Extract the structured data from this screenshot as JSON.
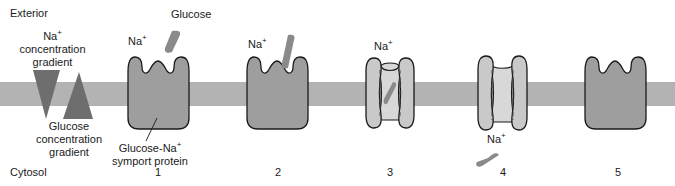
{
  "figure": {
    "type": "diagram",
    "compartments": {
      "top_label": "Exterior",
      "bottom_label": "Cytosol"
    },
    "gradients": [
      {
        "id": "na-gradient",
        "label_lines": [
          "Na",
          "concentration",
          "gradient"
        ],
        "line1_text": "Na",
        "line1_sup": "+",
        "line2_text": "concentration",
        "line3_text": "gradient",
        "direction": "downward",
        "shape": "triangle-pointing-down",
        "color": "#6e6e6e"
      },
      {
        "id": "glucose-gradient",
        "label_lines": [
          "Glucose",
          "concentration",
          "gradient"
        ],
        "line1_text": "Glucose",
        "line2_text": "concentration",
        "line3_text": "gradient",
        "direction": "upward",
        "shape": "triangle-pointing-up",
        "color": "#6e6e6e"
      }
    ],
    "protein_callout": {
      "line1_text": "Glucose-Na",
      "line1_sup": "+",
      "line2_text": "symport  protein"
    },
    "molecule_labels": {
      "sodium": "Na",
      "sodium_charge": "+",
      "glucose": "Glucose"
    },
    "steps": [
      {
        "number": "1",
        "state": "open-to-exterior, unbound",
        "na_label": "Na",
        "na_sup": "+",
        "glucose_label": "Glucose"
      },
      {
        "number": "2",
        "state": "glucose and Na+ binding from exterior",
        "na_label": "Na",
        "na_sup": "+"
      },
      {
        "number": "3",
        "state": "occluded, solutes enclosed in channel",
        "na_label": "Na",
        "na_sup": "+"
      },
      {
        "number": "4",
        "state": "open-to-cytosol, solutes released",
        "na_label": "Na",
        "na_sup": "+"
      },
      {
        "number": "5",
        "state": "reset to open-to-exterior, unbound"
      }
    ],
    "colors": {
      "membrane": "#b3b3b3",
      "protein_body": "#9e9e9e",
      "protein_lobe": "#c9c9c9",
      "protein_channel": "#d8d8d8",
      "glucose_molecule": "#8a8a8a",
      "gradient_triangle": "#6e6e6e",
      "outline": "#1a1a1a",
      "background": "#ffffff"
    }
  }
}
